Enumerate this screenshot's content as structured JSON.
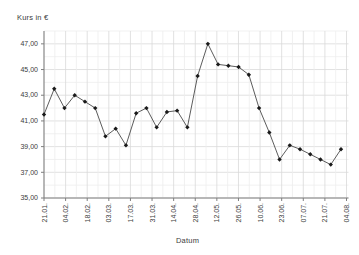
{
  "chart_data": {
    "type": "line",
    "title": "",
    "ylabel": "Kurs in €",
    "xlabel": "Datum",
    "x_tick_labels": [
      "21.01.",
      "04.02.",
      "18.02.",
      "03.03.",
      "17.03.",
      "31.03.",
      "14.04.",
      "28.04.",
      "12.05.",
      "26.05.",
      "10.06.",
      "23.06.",
      "07.07.",
      "21.07.",
      "04.08."
    ],
    "y_tick_labels": [
      "47,00",
      "45,00",
      "43,00",
      "41,00",
      "39,00",
      "37,00",
      "35,00"
    ],
    "y_ticks": [
      47,
      45,
      43,
      41,
      39,
      37,
      35
    ],
    "ylim": [
      35,
      48
    ],
    "x_interval": "weekly points, biweekly labels",
    "values": [
      41.5,
      43.5,
      42.0,
      43.0,
      42.5,
      42.0,
      39.8,
      40.4,
      39.1,
      41.6,
      42.0,
      40.5,
      41.7,
      41.8,
      40.5,
      44.5,
      47.0,
      45.4,
      45.3,
      45.2,
      44.6,
      42.0,
      40.1,
      38.0,
      39.1,
      38.8,
      38.4,
      38.0,
      37.6,
      38.8
    ],
    "legend": null,
    "grid": "fine light-gray grid: minor every 1 € and every 7 days, darker major every 2 € and 14 days",
    "colors": {
      "line": "#4a4a4a",
      "marker": "#1a1a1a",
      "axis": "#7f7f7f",
      "grid_minor": "#ededed",
      "grid_major": "#d9d9d9",
      "text": "#3c3c3c",
      "background": "#ffffff"
    }
  }
}
